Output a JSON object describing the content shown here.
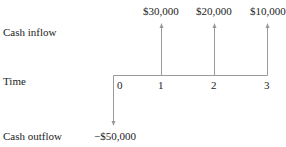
{
  "labels": {
    "cash_inflow": "Cash inflow",
    "time": "Time",
    "cash_outflow": "Cash outflow"
  },
  "periods": [
    "0",
    "1",
    "2",
    "3"
  ],
  "flows": {
    "t0": "−$50,000",
    "t1": "$30,000",
    "t2": "$20,000",
    "t3": "$10,000"
  },
  "colors": {
    "line": "#999999",
    "text": "#222222"
  }
}
